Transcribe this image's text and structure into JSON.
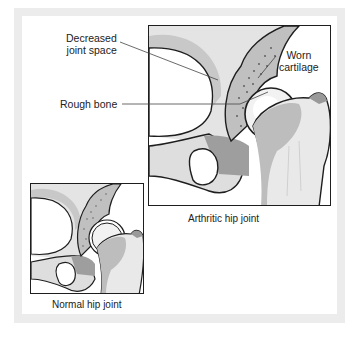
{
  "figure": {
    "panels": [
      {
        "id": "arthritic",
        "caption": "Arthritic hip joint"
      },
      {
        "id": "normal",
        "caption": "Normal hip joint"
      }
    ],
    "labels": {
      "decreased_joint_space_line1": "Decreased",
      "decreased_joint_space_line2": "joint space",
      "rough_bone": "Rough bone",
      "worn_cartilage_line1": "Worn",
      "worn_cartilage_line2": "cartilage"
    },
    "colors": {
      "frame": "#ececec",
      "outline": "#1e1e1e",
      "bone_light": "#e6e6e6",
      "bone_mid": "#bdbdbd",
      "bone_dark": "#9a9a9a",
      "text": "#222222"
    }
  }
}
